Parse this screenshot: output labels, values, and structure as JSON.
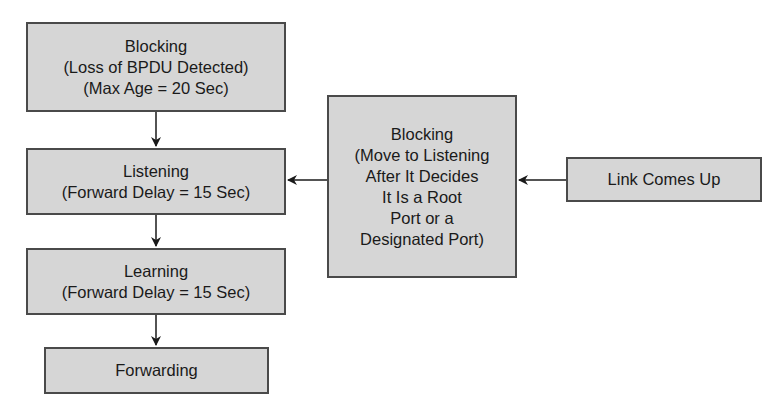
{
  "diagram": {
    "nodes": {
      "blocking_loss": {
        "lines": [
          "Blocking",
          "(Loss of BPDU Detected)",
          "(Max Age = 20 Sec)"
        ]
      },
      "listening": {
        "lines": [
          "Listening",
          "(Forward Delay = 15 Sec)"
        ]
      },
      "learning": {
        "lines": [
          "Learning",
          "(Forward Delay = 15 Sec)"
        ]
      },
      "forwarding": {
        "lines": [
          "Forwarding"
        ]
      },
      "blocking_link": {
        "lines": [
          "Blocking",
          "(Move to Listening",
          "After It Decides",
          "It Is a Root",
          "Port or a",
          "Designated Port)"
        ]
      },
      "link_up": {
        "lines": [
          "Link Comes Up"
        ]
      }
    },
    "edges": [
      {
        "from": "blocking_loss",
        "to": "listening"
      },
      {
        "from": "listening",
        "to": "learning"
      },
      {
        "from": "learning",
        "to": "forwarding"
      },
      {
        "from": "blocking_link",
        "to": "listening"
      },
      {
        "from": "link_up",
        "to": "blocking_link"
      }
    ],
    "colors": {
      "box_fill": "#d6d6d6",
      "box_border": "#4a4a4a",
      "arrow": "#1a1a1a"
    }
  }
}
